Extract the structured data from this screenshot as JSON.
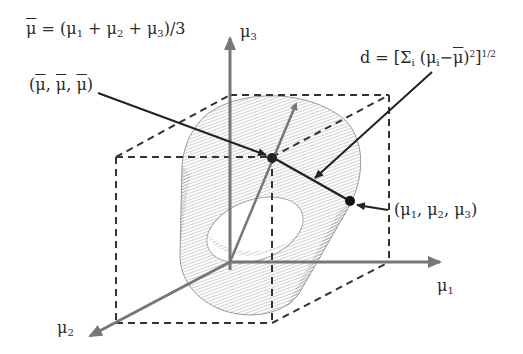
{
  "diagram": {
    "type": "3d-geometry",
    "axes": {
      "mu1": {
        "label": "μ",
        "sub": "1"
      },
      "mu2": {
        "label": "μ",
        "sub": "2"
      },
      "mu3": {
        "label": "μ",
        "sub": "3"
      }
    },
    "equations": {
      "mean": {
        "lhs": "μ",
        "rhs": " = (μ",
        "s1": "1",
        "p1": " + μ",
        "s2": "2",
        "p2": " + μ",
        "s3": "3",
        "end": ")/3"
      },
      "distance": {
        "lhs": "d = [Σ",
        "sub_i": "i",
        "mid": " (μ",
        "sub_i2": "i",
        "minus": "−",
        "mubar": "μ",
        "close": ")",
        "sq": "2",
        "bracket": "]",
        "exp": "1/2"
      }
    },
    "points": {
      "mean_point": {
        "open": "(",
        "a": "μ",
        "sep1": ", ",
        "b": "μ",
        "sep2": ", ",
        "c": "μ",
        "close": ")"
      },
      "sample_point": {
        "open": "(μ",
        "s1": "1",
        "sep1": ", μ",
        "s2": "2",
        "sep2": ", μ",
        "s3": "3",
        "close": ")"
      }
    },
    "colors": {
      "axis": "#777777",
      "line": "#222222",
      "dash": "#333333",
      "cylinder": "#999999"
    }
  }
}
